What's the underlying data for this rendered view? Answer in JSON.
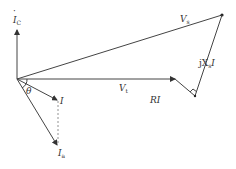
{
  "diagram": {
    "type": "phasor-diagram",
    "origin": [
      17,
      79
    ],
    "labels": {
      "ic": "I",
      "ic_sub": "C",
      "vs": "V",
      "vs_sub": "s",
      "vt": "V",
      "vt_sub": "t",
      "ri": "RI",
      "jxsi_prefix": "jX",
      "jxsi_sub": "s",
      "jxsi_suffix": "I",
      "i": "I",
      "ia": "I",
      "ia_sub": "a",
      "theta": "θ"
    },
    "colors": {
      "line": "#444444",
      "text": "#333333",
      "dashed": "#777777"
    }
  }
}
